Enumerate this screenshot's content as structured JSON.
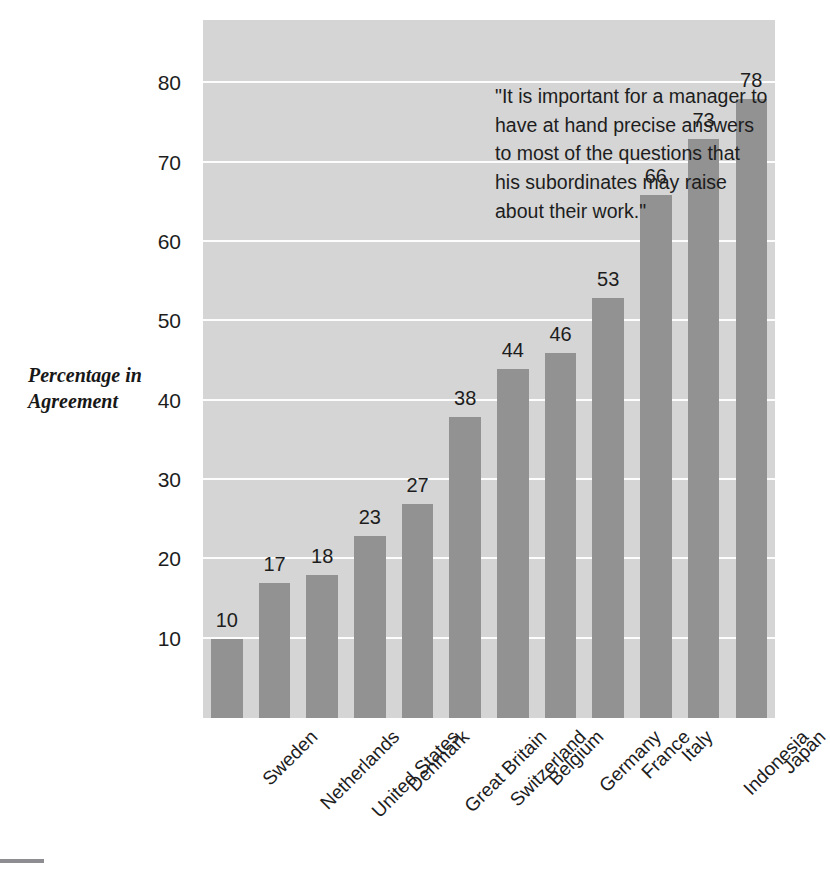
{
  "chart_data": {
    "type": "bar",
    "title": "",
    "annotation": "\"It is important for a manager to\nhave at hand precise answers\nto most of the questions that\nhis subordinates may raise\nabout their work.\"",
    "xlabel": "",
    "ylabel": "Percentage\nin Agreement",
    "categories": [
      "Sweden",
      "Netherlands",
      "United States",
      "Denmark",
      "Great Britain",
      "Switzerland",
      "Belgium",
      "Germany",
      "France",
      "Italy",
      "Indonesia",
      "Japan"
    ],
    "values": [
      10,
      17,
      18,
      23,
      27,
      38,
      44,
      46,
      53,
      66,
      73,
      78
    ],
    "value_labels": [
      "10",
      "17",
      "18",
      "23",
      "27",
      "38",
      "44",
      "46",
      "53",
      "66",
      "73",
      "78"
    ],
    "ylim": [
      0,
      88
    ],
    "yticks": [
      10,
      20,
      30,
      40,
      50,
      60,
      70,
      80
    ],
    "ytick_labels": [
      "10",
      "20",
      "30",
      "40",
      "50",
      "60",
      "70",
      "80"
    ],
    "grid": true,
    "gridline_color": "#fdfdfd",
    "legend": null,
    "bar_color": "#929292",
    "plot_background": "#d5d5d5",
    "text_color": "#1d1d1d"
  }
}
